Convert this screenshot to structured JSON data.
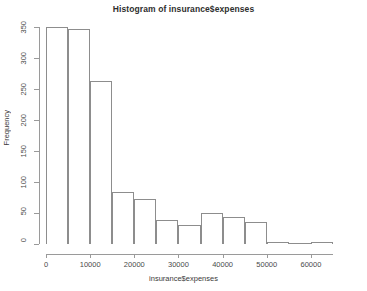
{
  "chart_data": {
    "type": "bar",
    "title": "Histogram of insurance$expenses",
    "xlabel": "insurance$expenses",
    "ylabel": "Frequency",
    "grid": false,
    "legend": false,
    "xlim": [
      0,
      65000
    ],
    "ylim": [
      0,
      350
    ],
    "bin_width": 5000,
    "xticks": [
      0,
      10000,
      20000,
      30000,
      40000,
      50000,
      60000
    ],
    "xtick_labels": [
      "0",
      "10000",
      "20000",
      "30000",
      "40000",
      "50000",
      "60000"
    ],
    "yticks": [
      0,
      50,
      100,
      150,
      200,
      250,
      300,
      350
    ],
    "ytick_labels": [
      "0",
      "50",
      "100",
      "150",
      "200",
      "250",
      "300",
      "350"
    ],
    "bins": [
      {
        "start": 0,
        "end": 5000,
        "count": 350
      },
      {
        "start": 5000,
        "end": 10000,
        "count": 347
      },
      {
        "start": 10000,
        "end": 15000,
        "count": 263
      },
      {
        "start": 15000,
        "end": 20000,
        "count": 84
      },
      {
        "start": 20000,
        "end": 25000,
        "count": 72
      },
      {
        "start": 25000,
        "end": 30000,
        "count": 39
      },
      {
        "start": 30000,
        "end": 35000,
        "count": 31
      },
      {
        "start": 35000,
        "end": 40000,
        "count": 50
      },
      {
        "start": 40000,
        "end": 45000,
        "count": 44
      },
      {
        "start": 45000,
        "end": 50000,
        "count": 36
      },
      {
        "start": 50000,
        "end": 55000,
        "count": 4
      },
      {
        "start": 55000,
        "end": 60000,
        "count": 2
      },
      {
        "start": 60000,
        "end": 65000,
        "count": 3
      }
    ],
    "categories": [
      "0-5000",
      "5000-10000",
      "10000-15000",
      "15000-20000",
      "20000-25000",
      "25000-30000",
      "30000-35000",
      "35000-40000",
      "40000-45000",
      "45000-50000",
      "50000-55000",
      "55000-60000",
      "60000-65000"
    ],
    "values": [
      350,
      347,
      263,
      84,
      72,
      39,
      31,
      50,
      44,
      36,
      4,
      2,
      3
    ]
  },
  "style": {
    "bar_border_color": "#8d8d8d",
    "bar_fill_color": "#ffffff",
    "axis_color": "#9a9a9a",
    "text_color": "#3a3a3a",
    "background": "#ffffff"
  }
}
